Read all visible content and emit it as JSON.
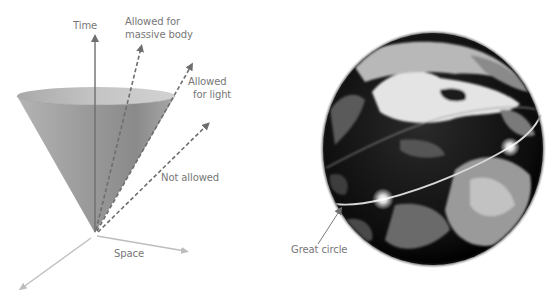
{
  "light_cone": {
    "axes": {
      "time_label": "Time",
      "space_label": "Space"
    },
    "arrows": [
      {
        "id": "massive",
        "label_line1": "Allowed for",
        "label_line2": "massive body"
      },
      {
        "id": "light",
        "label_line1": "Allowed",
        "label_line2": "for light"
      },
      {
        "id": "not_allowed",
        "label_line1": "Not allowed"
      }
    ]
  },
  "globe": {
    "callout_label": "Great circle"
  },
  "colors": {
    "cone_fill": "#9a9a9a",
    "arrow": "#6e6e6e",
    "axis_light": "#bdbdbd",
    "label": "#777777",
    "globe_dark": "#0a0a0a",
    "globe_cloud": "#e6e6e6"
  }
}
